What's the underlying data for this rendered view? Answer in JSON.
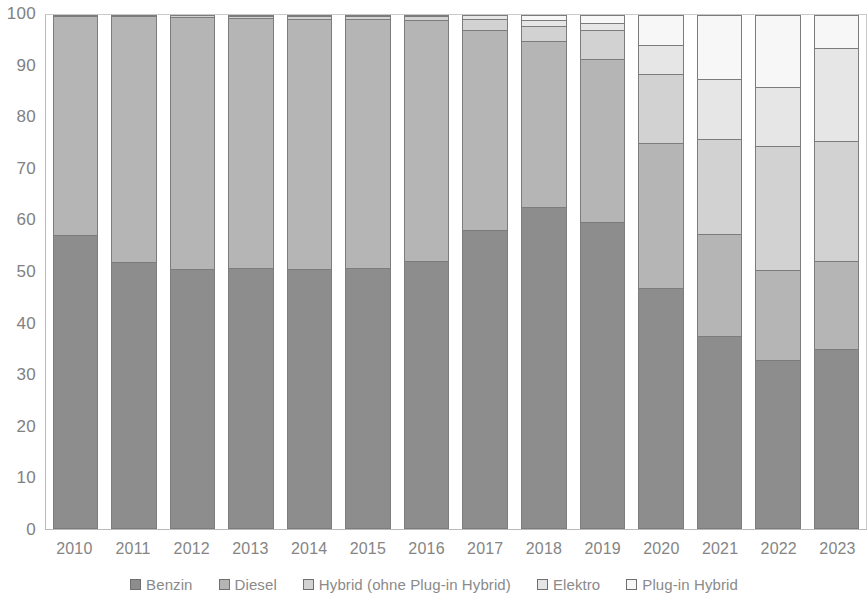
{
  "chart_data": {
    "type": "bar",
    "stacked": true,
    "stack_mode": "percent",
    "title": "",
    "subtitle": "",
    "xlabel": "",
    "ylabel": "",
    "ylim": [
      0,
      100
    ],
    "yticks": [
      0,
      10,
      20,
      30,
      40,
      50,
      60,
      70,
      80,
      90,
      100
    ],
    "ytick_labels": [
      "0",
      "10",
      "20",
      "30",
      "40",
      "50",
      "60",
      "70",
      "80",
      "90",
      "100"
    ],
    "grid": false,
    "legend_position": "bottom",
    "categories": [
      "2010",
      "2011",
      "2012",
      "2013",
      "2014",
      "2015",
      "2016",
      "2017",
      "2018",
      "2019",
      "2020",
      "2021",
      "2022",
      "2023"
    ],
    "series": [
      {
        "name": "Benzin",
        "color": "#8d8d8d",
        "values": [
          57.2,
          51.9,
          50.6,
          50.8,
          50.6,
          50.8,
          52.1,
          58.2,
          62.6,
          59.7,
          46.9,
          37.5,
          32.9,
          35.0
        ]
      },
      {
        "name": "Diesel",
        "color": "#b5b5b5",
        "values": [
          42.6,
          47.9,
          49.0,
          48.7,
          48.8,
          48.5,
          46.9,
          38.9,
          32.4,
          31.8,
          28.2,
          19.8,
          17.5,
          17.1
        ]
      },
      {
        "name": "Hybrid (ohne Plug-in Hybrid)",
        "color": "#d2d2d2",
        "values": [
          0.2,
          0.2,
          0.4,
          0.4,
          0.5,
          0.6,
          0.8,
          2.1,
          2.9,
          5.5,
          13.5,
          18.5,
          24.1,
          23.4
        ]
      },
      {
        "name": "Elektro",
        "color": "#e6e6e6",
        "values": [
          0.0,
          0.0,
          0.0,
          0.1,
          0.1,
          0.1,
          0.2,
          0.8,
          1.1,
          1.5,
          5.6,
          11.7,
          11.6,
          18.0
        ]
      },
      {
        "name": "Plug-in Hybrid",
        "color": "#f7f7f7",
        "values": [
          0.0,
          0.0,
          0.0,
          0.0,
          0.0,
          0.0,
          0.0,
          0.0,
          1.0,
          1.5,
          5.8,
          12.5,
          13.9,
          6.5
        ]
      }
    ]
  },
  "legend": {
    "items": [
      {
        "label": "Benzin",
        "color": "#8d8d8d"
      },
      {
        "label": "Diesel",
        "color": "#b5b5b5"
      },
      {
        "label": "Hybrid (ohne Plug-in Hybrid)",
        "color": "#d2d2d2"
      },
      {
        "label": "Elektro",
        "color": "#e6e6e6"
      },
      {
        "label": "Plug-in Hybrid",
        "color": "#f7f7f7"
      }
    ]
  }
}
